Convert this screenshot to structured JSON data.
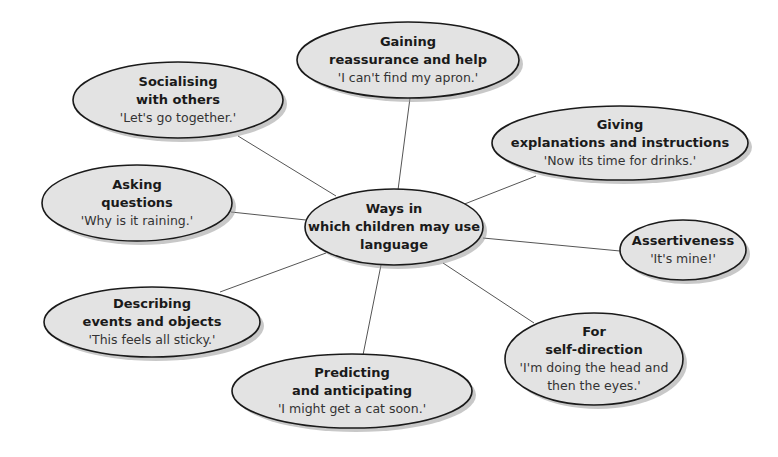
{
  "diagram": {
    "center": {
      "title_lines": [
        "Ways in",
        "which children may use",
        "language"
      ],
      "cx": 394,
      "cy": 227,
      "rx": 89,
      "ry": 38
    },
    "nodes": [
      {
        "id": "gaining",
        "title_lines": [
          "Gaining",
          "reassurance and help"
        ],
        "quote_lines": [
          "'I can't find my apron.'"
        ],
        "cx": 408,
        "cy": 60,
        "rx": 111,
        "ry": 38,
        "line": [
          398,
          190,
          410,
          98
        ]
      },
      {
        "id": "socialising",
        "title_lines": [
          "Socialising",
          "with others"
        ],
        "quote_lines": [
          "'Let's go together.'"
        ],
        "cx": 178,
        "cy": 100,
        "rx": 105,
        "ry": 38,
        "line": [
          336,
          196,
          238,
          136
        ]
      },
      {
        "id": "giving",
        "title_lines": [
          "Giving",
          "explanations and instructions"
        ],
        "quote_lines": [
          "'Now its time for drinks.'"
        ],
        "cx": 620,
        "cy": 143,
        "rx": 128,
        "ry": 37,
        "line": [
          462,
          205,
          536,
          176
        ]
      },
      {
        "id": "asking",
        "title_lines": [
          "Asking",
          "questions"
        ],
        "quote_lines": [
          "'Why is it raining.'"
        ],
        "cx": 137,
        "cy": 203,
        "rx": 95,
        "ry": 38,
        "line": [
          306,
          220,
          231,
          212
        ]
      },
      {
        "id": "assertiveness",
        "title_lines": [
          "Assertiveness"
        ],
        "quote_lines": [
          "'It's mine!'"
        ],
        "cx": 683,
        "cy": 250,
        "rx": 63,
        "ry": 30,
        "line": [
          483,
          238,
          620,
          251
        ]
      },
      {
        "id": "describing",
        "title_lines": [
          "Describing",
          "events and objects"
        ],
        "quote_lines": [
          "'This feels all sticky.'"
        ],
        "cx": 152,
        "cy": 322,
        "rx": 108,
        "ry": 35,
        "line": [
          326,
          253,
          220,
          292
        ]
      },
      {
        "id": "self-direction",
        "title_lines": [
          "For",
          "self-direction"
        ],
        "quote_lines": [
          "'I'm doing the head and",
          "then the eyes.'"
        ],
        "cx": 594,
        "cy": 359,
        "rx": 89,
        "ry": 46,
        "line": [
          443,
          263,
          534,
          323
        ]
      },
      {
        "id": "predicting",
        "title_lines": [
          "Predicting",
          "and anticipating"
        ],
        "quote_lines": [
          "'I might get a cat soon.'"
        ],
        "cx": 352,
        "cy": 391,
        "rx": 120,
        "ry": 37,
        "line": [
          381,
          265,
          363,
          355
        ]
      }
    ],
    "colors": {
      "fill": "#e3e3e3",
      "stroke": "#1a1a1a",
      "shadow": "#9a9a9a",
      "connector": "#555555"
    }
  }
}
